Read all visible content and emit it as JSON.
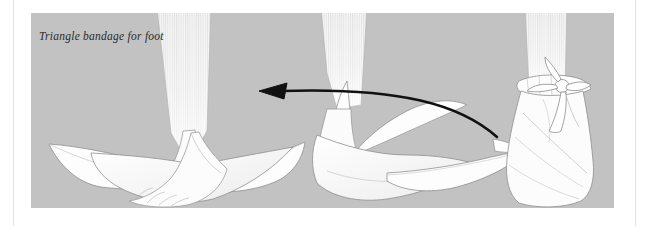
{
  "page": {
    "background_color": "#ffffff",
    "margin_rule_color": "#e3e3e3"
  },
  "figure": {
    "caption": "Triangle bandage for foot",
    "panel_background": "#c2c2c2",
    "bandage_fill": "#fdfdfd",
    "outline_color": "#8a8a8a",
    "arrow_color": "#111111",
    "leg_stripe_color": "#f2f2f2",
    "panel": {
      "x": 31,
      "y": 13,
      "width": 583,
      "height": 195
    },
    "steps": [
      {
        "name": "step-1-bandage-spread-flat",
        "description": "Bare foot resting on an open triangular bandage spread flat on the ground, point forward under the toes and two long wings extending to either side"
      },
      {
        "name": "step-2-bandage-folded-over-foot",
        "description": "Triangular bandage folded up over the top of the foot, the apex drawn back over the instep and the side wings crossed over"
      },
      {
        "name": "step-3-bandage-tied-at-ankle",
        "description": "Completed foot bandage with the two ends brought around the ankle and tied off in a knot on the front of the ankle"
      }
    ],
    "arrow": {
      "name": "motion-arrow",
      "direction": "right-to-left",
      "description": "Curved arrow pointing from the finished tied bandage back toward the folded bandage step"
    }
  }
}
